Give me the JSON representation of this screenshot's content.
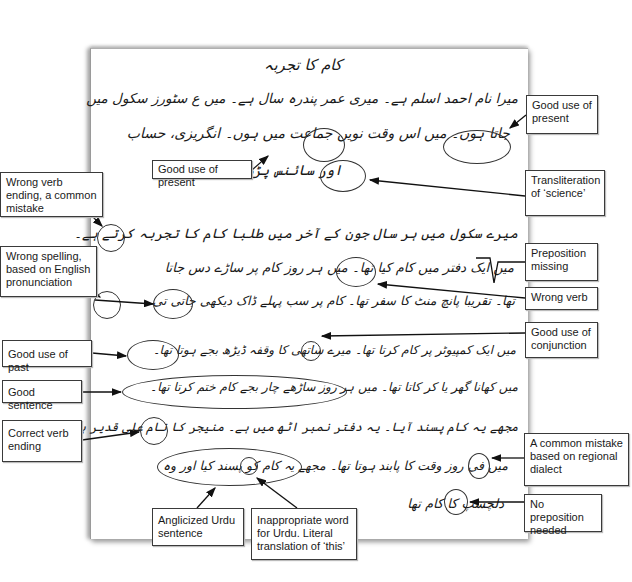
{
  "document": {
    "title": "کام کا تجربہ",
    "lines": [
      "میرا نام احمد اسلم ہے۔ میری عمر پندرہ سال ہے۔ میں ع سٹورز سکول میں",
      "جاتا ہوں۔ میں اس وقت نویں جماعت میں ہوں۔ انگریزی، حساب",
      "اور سائنس پڑھتا ہوں۔",
      "میرے سکول میں ہر سال جون کے آخر میں طلبا کام کا تجربہ کرتے ہے۔",
      "میں ایک دفتر میں کام کیا تھا۔ میں ہر روز کام پر ساڑے دس جاتا",
      "تھا۔ تقریبا پانچ منٹ کا سفر تھا۔ کام پر سب پہلے ڈاک دیکھی جاتی تی۔",
      "میں ایک کمپیوٹر پر کام کرتا تھا۔ میرے ساتھی کا وقفہ ڈیڑھ بجے ہوتا تھا۔",
      "میں کھانا گھر یا کر کاتا تھا۔ میں ہر روز ساڑھے چار بجے کام ختم کرتا تھا۔",
      "مجھے یہ کام پسند آیا۔ یہ دفتر نمبر اٹھ میں ہے۔ منیجر کا نام علی قدیر ہے۔",
      "میں فی روز وقت کا پابند ہوتا تھا۔ مجھے یہ کام کو پسند کیا اور وہ",
      "دلچسپ کا کام تھا"
    ]
  },
  "annotations": {
    "right": [
      {
        "id": "good-use-of-present-1",
        "text": "Good use of present"
      },
      {
        "id": "transliteration",
        "text": "Transliteration of ‘science’"
      },
      {
        "id": "preposition-missing",
        "text": "Preposition missing"
      },
      {
        "id": "wrong-verb",
        "text": "Wrong verb"
      },
      {
        "id": "good-use-of-conjunction",
        "text": "Good use of conjunction"
      },
      {
        "id": "regional-dialect",
        "text": "A common mistake based on regional dialect"
      },
      {
        "id": "no-preposition-needed",
        "text": "No preposition needed"
      }
    ],
    "left": [
      {
        "id": "wrong-verb-ending",
        "text": "Wrong verb ending, a common mistake"
      },
      {
        "id": "wrong-spelling",
        "text": "Wrong spelling, based on English pronunciation"
      },
      {
        "id": "good-use-of-past",
        "text": "Good use of past"
      },
      {
        "id": "good-sentence",
        "text": "Good sentence"
      },
      {
        "id": "correct-verb-ending",
        "text": "Correct verb ending"
      }
    ],
    "inline": [
      {
        "id": "good-use-of-present-2",
        "text": "Good use of present"
      }
    ],
    "bottom": [
      {
        "id": "anglicized-urdu",
        "text": "Anglicized Urdu sentence"
      },
      {
        "id": "inappropriate-word",
        "text": "Inappropriate word for Urdu. Literal translation of ‘this’"
      }
    ]
  }
}
